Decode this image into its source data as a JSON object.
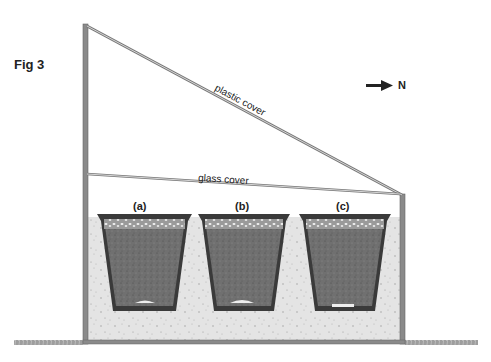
{
  "figure": {
    "title": "Fig 3",
    "north_label": "N",
    "labels": {
      "plastic_cover": "plastic cover",
      "glass_cover": "glass cover"
    },
    "pots": [
      {
        "id": "a",
        "label": "(a)"
      },
      {
        "id": "b",
        "label": "(b)"
      },
      {
        "id": "c",
        "label": "(c)"
      }
    ],
    "colors": {
      "frame": "#8a8a8a",
      "soil_bed": "#e2e2e2",
      "pot_wall": "#3a3a3a",
      "pot_fill": "#6e6e6e",
      "text": "#222222"
    }
  }
}
